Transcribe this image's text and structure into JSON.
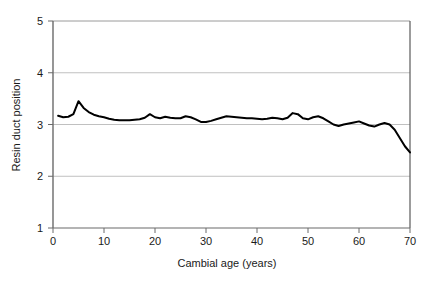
{
  "chart_data": {
    "type": "line",
    "title": "",
    "xlabel": "Cambial age (years)",
    "ylabel": "Resin duct position",
    "xlim": [
      0,
      70
    ],
    "ylim": [
      1,
      5
    ],
    "xticks": [
      0,
      10,
      20,
      30,
      40,
      50,
      60,
      70
    ],
    "yticks": [
      1,
      2,
      3,
      4,
      5
    ],
    "grid": "horizontal",
    "legend": "none",
    "line_color": "#000000",
    "grid_color": "#bfbfbf",
    "axis_color": "#808080",
    "background": "#ffffff",
    "series": [
      {
        "name": "Resin duct position",
        "x": [
          1,
          2,
          3,
          4,
          5,
          6,
          7,
          8,
          9,
          10,
          11,
          12,
          13,
          14,
          15,
          16,
          17,
          18,
          19,
          20,
          21,
          22,
          23,
          24,
          25,
          26,
          27,
          28,
          29,
          30,
          31,
          32,
          33,
          34,
          35,
          36,
          37,
          38,
          39,
          40,
          41,
          42,
          43,
          44,
          45,
          46,
          47,
          48,
          49,
          50,
          51,
          52,
          53,
          54,
          55,
          56,
          57,
          58,
          59,
          60,
          61,
          62,
          63,
          64,
          65,
          66,
          67,
          68,
          69,
          70
        ],
        "values": [
          3.17,
          3.14,
          3.15,
          3.2,
          3.45,
          3.32,
          3.24,
          3.19,
          3.16,
          3.14,
          3.11,
          3.09,
          3.08,
          3.08,
          3.08,
          3.09,
          3.1,
          3.13,
          3.2,
          3.14,
          3.12,
          3.15,
          3.13,
          3.12,
          3.12,
          3.16,
          3.14,
          3.1,
          3.05,
          3.05,
          3.07,
          3.1,
          3.13,
          3.16,
          3.15,
          3.14,
          3.13,
          3.12,
          3.12,
          3.11,
          3.1,
          3.11,
          3.13,
          3.12,
          3.1,
          3.13,
          3.22,
          3.2,
          3.12,
          3.1,
          3.14,
          3.16,
          3.12,
          3.06,
          3.0,
          2.97,
          3.0,
          3.02,
          3.04,
          3.06,
          3.02,
          2.98,
          2.96,
          3.0,
          3.03,
          3.0,
          2.9,
          2.74,
          2.58,
          2.46
        ]
      }
    ]
  },
  "axes": {
    "y_title": "Resin duct position",
    "x_title": "Cambial age (years)",
    "y_tick_labels": [
      "5",
      "4",
      "3",
      "2",
      "1"
    ],
    "x_tick_labels": [
      "0",
      "10",
      "20",
      "30",
      "40",
      "50",
      "60",
      "70"
    ]
  }
}
